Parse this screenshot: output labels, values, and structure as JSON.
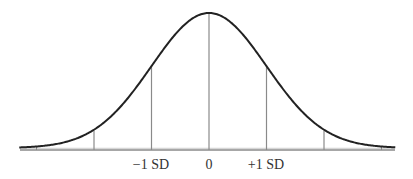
{
  "chart_data": {
    "type": "line",
    "title": "",
    "subtitle": "",
    "xlabel": "",
    "ylabel": "",
    "x_ticks": [
      {
        "value": -3,
        "label": ""
      },
      {
        "value": -2,
        "label": ""
      },
      {
        "value": -1,
        "label": "−1 SD"
      },
      {
        "value": 0,
        "label": "0"
      },
      {
        "value": 1,
        "label": "+1 SD"
      },
      {
        "value": 2,
        "label": ""
      },
      {
        "value": 3,
        "label": ""
      }
    ],
    "vertical_lines_at": [
      -2,
      -1,
      0,
      1,
      2
    ],
    "xlim": [
      -3.3,
      3.25
    ],
    "ylim": [
      0,
      1
    ],
    "grid": false,
    "legend": null,
    "series": [
      {
        "name": "normal density",
        "function": "exp(-x^2/2)",
        "mean": 0,
        "sd": 1
      }
    ]
  },
  "labels": {
    "minus_one_sd": "−1 SD",
    "zero": "0",
    "plus_one_sd": "+1 SD"
  },
  "colors": {
    "curve": "#222222",
    "axis": "#8a8a8a",
    "ref_lines": "#8a8a8a",
    "text": "#333333"
  }
}
